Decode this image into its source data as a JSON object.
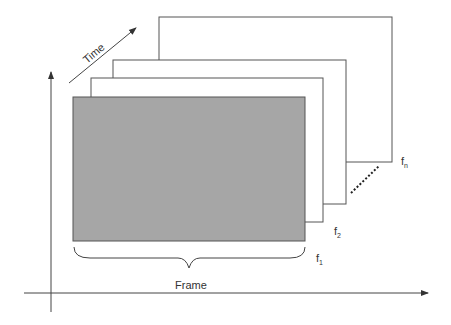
{
  "diagram": {
    "labels": {
      "time": "Time",
      "frame": "Frame",
      "f1": "f",
      "f1_sub": "1",
      "f2": "f",
      "f2_sub": "2",
      "fn": "f",
      "fn_sub": "n"
    },
    "colors": {
      "frame_fill": "#a6a6a6",
      "stroke": "#444444",
      "background": "#ffffff"
    },
    "frames": [
      {
        "id": "fn",
        "x": 159,
        "y": 17,
        "w": 233,
        "h": 145,
        "fill": "#ffffff"
      },
      {
        "id": "f3",
        "x": 113,
        "y": 60,
        "w": 233,
        "h": 144,
        "fill": "#ffffff"
      },
      {
        "id": "f2",
        "x": 91,
        "y": 78,
        "w": 232,
        "h": 144,
        "fill": "#ffffff"
      },
      {
        "id": "f1",
        "x": 73,
        "y": 97,
        "w": 232,
        "h": 144,
        "fill": "#a6a6a6"
      }
    ]
  }
}
